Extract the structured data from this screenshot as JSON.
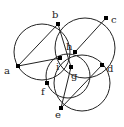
{
  "diagram": {
    "type": "geometry-circles",
    "stroke_color": "#222222",
    "points": [
      {
        "id": "a",
        "label": "a",
        "x": 18,
        "y": 66,
        "lx": 4,
        "ly": 74
      },
      {
        "id": "b",
        "label": "b",
        "x": 58,
        "y": 24,
        "lx": 52,
        "ly": 18
      },
      {
        "id": "c",
        "label": "c",
        "x": 106,
        "y": 18,
        "lx": 111,
        "ly": 23
      },
      {
        "id": "d",
        "label": "d",
        "x": 102,
        "y": 65,
        "lx": 107,
        "ly": 72
      },
      {
        "id": "e",
        "label": "e",
        "x": 61,
        "y": 108,
        "lx": 55,
        "ly": 118
      },
      {
        "id": "f",
        "label": "f",
        "x": 47,
        "y": 83,
        "lx": 41,
        "ly": 95
      },
      {
        "id": "g",
        "label": "g",
        "x": 71,
        "y": 67,
        "lx": 71,
        "ly": 79
      },
      {
        "id": "h",
        "label": "h",
        "x": 75,
        "y": 52,
        "lx": 66,
        "ly": 50
      },
      {
        "id": "i",
        "label": "i",
        "x": 60,
        "y": 58,
        "lx": 56,
        "ly": 70
      }
    ],
    "segments": [
      [
        "a",
        "b"
      ],
      [
        "a",
        "i"
      ],
      [
        "b",
        "g"
      ],
      [
        "h",
        "c"
      ],
      [
        "e",
        "g"
      ],
      [
        "e",
        "d"
      ]
    ],
    "circles": [
      {
        "cx": 42,
        "cy": 52,
        "r": 28
      },
      {
        "cx": 85,
        "cy": 48,
        "r": 30
      },
      {
        "cx": 82,
        "cy": 83,
        "r": 28
      },
      {
        "cx": 68,
        "cy": 76,
        "r": 22
      }
    ]
  }
}
